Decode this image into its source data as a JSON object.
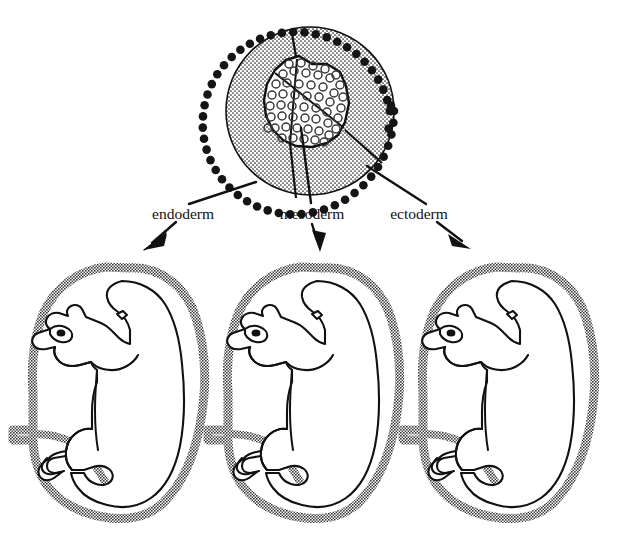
{
  "figure": {
    "background_color": "#ffffff",
    "width": 620,
    "height": 533
  },
  "blastocyst": {
    "name": "blastocyst",
    "center_x": 310,
    "center_y": 111,
    "radius": 86,
    "outline_color": "#000000",
    "interior_fill": "stipple-dot-pattern",
    "trophoblast_ring": {
      "name": "trophoblast-cell-ring",
      "cell_count": 54,
      "cell_color": "#111111",
      "cell_radius": 4.2
    },
    "inner_cell_mass": {
      "name": "inner-cell-mass",
      "fill": "#ffffff",
      "outline_color": "#000000",
      "cell_count": 52,
      "cell_outline_color": "#333333"
    },
    "division_lines": 3
  },
  "arrows": [
    {
      "name": "arrow-endoderm",
      "label": "endoderm",
      "label_x": 183,
      "label_y": 219,
      "direction": "down-left",
      "color": "#000000"
    },
    {
      "name": "arrow-mesoderm",
      "label": "mesoderm",
      "label_x": 312,
      "label_y": 219,
      "direction": "down",
      "color": "#000000"
    },
    {
      "name": "arrow-ectoderm",
      "label": "ectoderm",
      "label_x": 419,
      "label_y": 219,
      "direction": "down-right",
      "color": "#000000"
    }
  ],
  "embryos": [
    {
      "name": "embryo-endoderm",
      "index": 1,
      "offset_x": 0,
      "sac_color": "#828282",
      "body_outline_color": "#000000",
      "body_fill": "#ffffff"
    },
    {
      "name": "embryo-mesoderm",
      "index": 2,
      "offset_x": 195,
      "sac_color": "#828282",
      "body_outline_color": "#000000",
      "body_fill": "#ffffff"
    },
    {
      "name": "embryo-ectoderm",
      "index": 3,
      "offset_x": 390,
      "sac_color": "#828282",
      "body_outline_color": "#000000",
      "body_fill": "#ffffff"
    }
  ],
  "colors": {
    "ink": "#000000",
    "sac_gray": "#828282",
    "paper": "#ffffff"
  }
}
